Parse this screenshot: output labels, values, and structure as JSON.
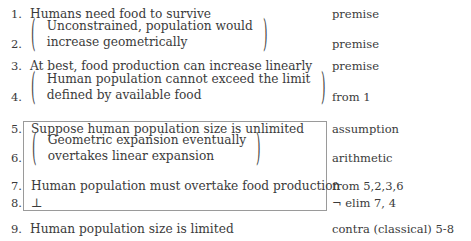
{
  "document": {
    "kind": "fitch-style-natural-deduction-proof",
    "text_color": "#3b3b3b",
    "background_color": "#ffffff",
    "box_border_color": "#9a9a9a"
  },
  "lines": [
    {
      "number": "1.",
      "statement": "Humans need food to survive",
      "justification": "premise",
      "bracketed": false,
      "in_box": false
    },
    {
      "number": "2.",
      "statement_line_1": "Unconstrained, population would",
      "statement_line_2": "increase geometrically",
      "justification": "premise",
      "bracketed": true,
      "in_box": false,
      "left_paren": "(",
      "right_paren": ")"
    },
    {
      "number": "3.",
      "statement": "At best, food production can increase linearly",
      "justification": "premise",
      "bracketed": false,
      "in_box": false
    },
    {
      "number": "4.",
      "statement_line_1": "Human population cannot exceed the limit",
      "statement_line_2": "defined by available food",
      "justification": "from 1",
      "bracketed": true,
      "in_box": false,
      "left_paren": "(",
      "right_paren": ")"
    },
    {
      "number": "5.",
      "statement": "Suppose human population size is unlimited",
      "justification": "assumption",
      "bracketed": false,
      "in_box": true
    },
    {
      "number": "6.",
      "statement_line_1": "Geometric expansion eventually",
      "statement_line_2": "overtakes linear expansion",
      "justification": "arithmetic",
      "bracketed": true,
      "in_box": true,
      "left_paren": "(",
      "right_paren": ")"
    },
    {
      "number": "7.",
      "statement": "Human population must overtake food production",
      "justification": "from 5,2,3,6",
      "bracketed": false,
      "in_box": true
    },
    {
      "number": "8.",
      "statement": "⊥",
      "justification": "¬ elim 7, 4",
      "bracketed": false,
      "in_box": true
    },
    {
      "number": "9.",
      "statement": "Human population size is limited",
      "justification": "contra (classical) 5-8",
      "bracketed": false,
      "in_box": false
    }
  ]
}
